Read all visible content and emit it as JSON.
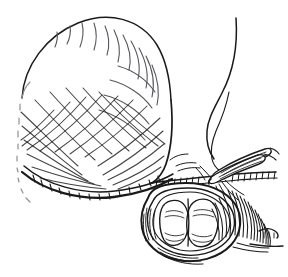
{
  "figure": {
    "domain_kind": "line-art-illustration",
    "title": "Surgical line drawing: sac with mesh overlay, forceps and suture at neck, open lumen cross-section",
    "medium": "pen-and-ink line art",
    "has_text_labels": false,
    "caption": "",
    "canvas": {
      "width_px": 288,
      "height_px": 277,
      "background_color": "#ffffff",
      "ink_color": "#1a1a1a",
      "faint_ink_color": "#8e8e96",
      "mid_ink_color": "#55555c"
    },
    "parts": [
      {
        "id": "sac-body",
        "name": "sac-body",
        "description": "Large rounded sac occupying upper left two-thirds, drawn as an open contour",
        "shading": "sparse radiating hatch strokes along upper-right and right flank"
      },
      {
        "id": "sac-left-edge",
        "name": "sac-left-edge",
        "description": "Broken dashed contour down the left side indicating a softened or receding edge",
        "shading": "dashed faint strokes"
      },
      {
        "id": "mesh-overlay",
        "name": "mesh-overlay",
        "description": "Diamond cross-hatched net covering the lower portion of the sac",
        "shading": "two families of crossing diagonal lines forming a lattice"
      },
      {
        "id": "sac-base-fold",
        "name": "sac-base-fold",
        "description": "Heavy dark curved band along the bottom of the sac where it folds over",
        "shading": "dense short tick hatching"
      },
      {
        "id": "neck-contour",
        "name": "neck-contour",
        "description": "Narrow curved contour at upper right descending toward the forceps tip"
      },
      {
        "id": "suture-thread",
        "name": "suture-thread",
        "description": "Thin S-curved filament running from upper right down to the instrument tip"
      },
      {
        "id": "forceps",
        "name": "forceps-instrument",
        "description": "Pair of fine tipped forceps angled down-left, grasping tissue at the neck",
        "shading": "parallel longitudinal lines along the shanks"
      },
      {
        "id": "cut-edge",
        "name": "cut-edge-hatching",
        "description": "Horizontal band of fine comb-like tick marks marking the incised margin"
      },
      {
        "id": "lumen-opening",
        "name": "lumen-opening",
        "description": "Open oval cavity at lower right viewed end-on"
      },
      {
        "id": "lobe-left",
        "name": "lumen-lobe-left",
        "description": "Left rounded lobe inside the opening, highlighted white with contour shading"
      },
      {
        "id": "lobe-right",
        "name": "lumen-lobe-right",
        "description": "Right rounded lobe inside the opening, highlighted white with contour shading"
      },
      {
        "id": "wall-shading",
        "name": "cavity-wall-shading",
        "description": "Dense parallel curved hatch lines on the right flank of the cavity indicating thickness and shadow"
      },
      {
        "id": "tail-flap",
        "name": "tail-flap",
        "description": "Small pointed flap of tissue extending to the right at the lower margin"
      }
    ]
  }
}
